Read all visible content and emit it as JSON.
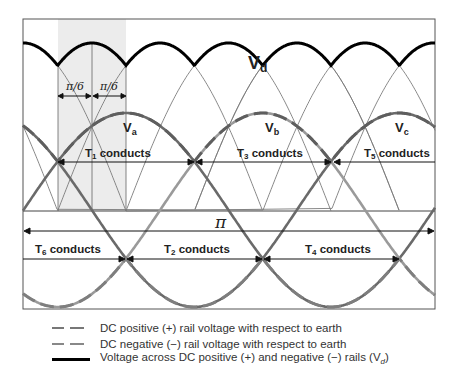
{
  "figure": {
    "curve_labels": {
      "vd": "V",
      "vd_sub": "d",
      "va": "V",
      "va_sub": "a",
      "vb": "V",
      "vb_sub": "b",
      "vc": "V",
      "vc_sub": "c"
    },
    "angle_labels": {
      "pi_over_6_left": "π/6",
      "pi_over_6_right": "π/6",
      "pi": "π"
    },
    "conduction_labels": {
      "t1": {
        "T": "T",
        "sub": "1",
        "text": " conducts"
      },
      "t3": {
        "T": "T",
        "sub": "3",
        "text": " conducts"
      },
      "t5": {
        "T": "T",
        "sub": "5",
        "text": " conducts"
      },
      "t6": {
        "T": "T",
        "sub": "6",
        "text": " conducts"
      },
      "t2": {
        "T": "T",
        "sub": "2",
        "text": " conducts"
      },
      "t4": {
        "T": "T",
        "sub": "4",
        "text": " conducts"
      }
    },
    "colors": {
      "vd_line": "#000000",
      "frame": "#555555",
      "shade": "#ececec",
      "positive_rail": "#6f6f6f",
      "negative_rail": "#8a8a8a",
      "light_segment": "#d0d0d0",
      "thin_line": "#777777"
    }
  },
  "legend": {
    "items": [
      {
        "style": "dashed-dark",
        "label": "DC positive (+) rail voltage with respect to earth"
      },
      {
        "style": "dashed-light",
        "label": "DC negative (−) rail voltage with respect to earth"
      },
      {
        "style": "solid-black",
        "label": "Voltage across DC positive (+) and negative (−) rails (V",
        "label_sub": "d",
        "label_end": ")"
      }
    ]
  }
}
